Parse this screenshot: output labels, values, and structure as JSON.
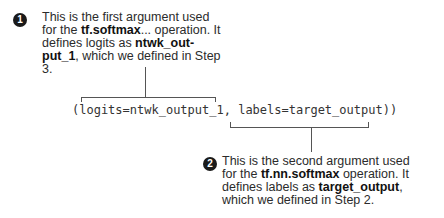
{
  "callout_1": {
    "number": "1",
    "line1": "This is the first argument used",
    "line2_pre": "for the ",
    "line2_bold": "tf.softmax",
    "line2_post": "... operation. It",
    "line3_pre": "defines logits as  ",
    "line3_bold": "ntwk_out-",
    "line4_bold": "put_1",
    "line4_post": ", which we defined in Step",
    "line5": "3."
  },
  "code": {
    "text": "(logits=ntwk_output_1, labels=target_output))"
  },
  "callout_2": {
    "number": "2",
    "line1": "This is the second argument used",
    "line2_pre": "for the ",
    "line2_bold": "tf.nn.softmax",
    "line2_post": " operation. It",
    "line3_pre": "defines labels as ",
    "line3_bold": "target_output",
    "line3_post": ",",
    "line4": "which we defined in Step 2."
  }
}
